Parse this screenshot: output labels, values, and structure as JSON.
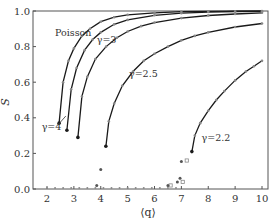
{
  "chart_data": {
    "type": "line",
    "title": "",
    "xlabel": "⟨q⟩",
    "ylabel": "S",
    "xlim": [
      1.55,
      10
    ],
    "ylim": [
      0.0,
      1.0
    ],
    "xticks": [
      2,
      3,
      4,
      5,
      6,
      7,
      8,
      9,
      10
    ],
    "yticks": [
      0.0,
      0.2,
      0.4,
      0.6,
      0.8,
      1.0
    ],
    "xtick_labels": [
      "2",
      "3",
      "4",
      "5",
      "6",
      "7",
      "8",
      "9",
      "10"
    ],
    "ytick_labels": [
      "0.0",
      "0.2",
      "0.4",
      "0.6",
      "0.8",
      "1.0"
    ],
    "grid": false,
    "legend": null,
    "series": [
      {
        "name": "Poisson",
        "label_pos": [
          2.3,
          0.86
        ],
        "q_c": 2.45,
        "S_c": 0.37,
        "x": [
          2.45,
          2.6,
          2.8,
          3.0,
          3.3,
          3.6,
          4.0,
          4.5,
          5.0,
          6.0,
          7.0,
          8.0,
          9.0,
          10.0
        ],
        "values": [
          0.37,
          0.6,
          0.72,
          0.79,
          0.86,
          0.9,
          0.94,
          0.965,
          0.978,
          0.99,
          0.996,
          0.998,
          0.999,
          1.0
        ]
      },
      {
        "name": "γ=4",
        "label_pos": [
          1.8,
          0.33
        ],
        "q_c": 2.74,
        "S_c": 0.33,
        "x": [
          2.74,
          2.9,
          3.1,
          3.4,
          3.7,
          4.0,
          4.5,
          5.0,
          6.0,
          7.0,
          8.0,
          9.0,
          10.0
        ],
        "values": [
          0.33,
          0.56,
          0.68,
          0.78,
          0.84,
          0.88,
          0.925,
          0.95,
          0.976,
          0.988,
          0.994,
          0.997,
          0.998
        ]
      },
      {
        "name": "γ=3",
        "label_pos": [
          3.85,
          0.82
        ],
        "q_c": 3.15,
        "S_c": 0.29,
        "x": [
          3.15,
          3.3,
          3.5,
          3.8,
          4.2,
          4.6,
          5.0,
          5.5,
          6.0,
          7.0,
          8.0,
          9.0,
          10.0
        ],
        "values": [
          0.29,
          0.52,
          0.63,
          0.73,
          0.8,
          0.85,
          0.885,
          0.915,
          0.935,
          0.96,
          0.975,
          0.983,
          0.99
        ]
      },
      {
        "name": "γ=2.5",
        "label_pos": [
          5.05,
          0.63
        ],
        "q_c": 4.19,
        "S_c": 0.24,
        "x": [
          4.19,
          4.3,
          4.5,
          4.8,
          5.2,
          5.6,
          6.0,
          6.5,
          7.0,
          7.5,
          8.0,
          9.0,
          10.0
        ],
        "values": [
          0.24,
          0.38,
          0.48,
          0.58,
          0.66,
          0.72,
          0.76,
          0.8,
          0.835,
          0.86,
          0.88,
          0.91,
          0.93
        ]
      },
      {
        "name": "γ=2.2",
        "label_pos": [
          7.75,
          0.27
        ],
        "q_c": 7.39,
        "S_c": 0.21,
        "x": [
          7.39,
          7.5,
          7.7,
          8.0,
          8.3,
          8.6,
          9.0,
          9.4,
          9.7,
          10.0
        ],
        "values": [
          0.21,
          0.3,
          0.37,
          0.44,
          0.5,
          0.55,
          0.61,
          0.66,
          0.69,
          0.72
        ]
      }
    ],
    "subcritical_points": [
      {
        "x": 3.85,
        "y": 0.02,
        "marker": "filled"
      },
      {
        "x": 4.0,
        "y": 0.11,
        "marker": "filled"
      },
      {
        "x": 6.85,
        "y": 0.04,
        "marker": "filled"
      },
      {
        "x": 6.95,
        "y": 0.06,
        "marker": "filled"
      },
      {
        "x": 7.0,
        "y": 0.155,
        "marker": "filled"
      },
      {
        "x": 7.2,
        "y": 0.16,
        "marker": "open"
      },
      {
        "x": 7.05,
        "y": 0.04,
        "marker": "open"
      },
      {
        "x": 6.6,
        "y": 0.02,
        "marker": "open"
      },
      {
        "x": 6.5,
        "y": 0.02,
        "marker": "filled"
      }
    ],
    "annotations": [
      {
        "text": "Poisson",
        "x": 2.3,
        "y": 0.86
      },
      {
        "text": "γ=3",
        "x": 3.85,
        "y": 0.82
      },
      {
        "text": "γ=2.5",
        "x": 5.05,
        "y": 0.63
      },
      {
        "text": "γ=2.2",
        "x": 7.75,
        "y": 0.27
      },
      {
        "text": "γ=4",
        "x": 1.8,
        "y": 0.33,
        "arrow_to": [
          2.7,
          0.41
        ]
      }
    ]
  },
  "colors": {
    "line": "#1a1a1a",
    "marker": "#888888",
    "axis": "#555555",
    "text": "#333333"
  }
}
